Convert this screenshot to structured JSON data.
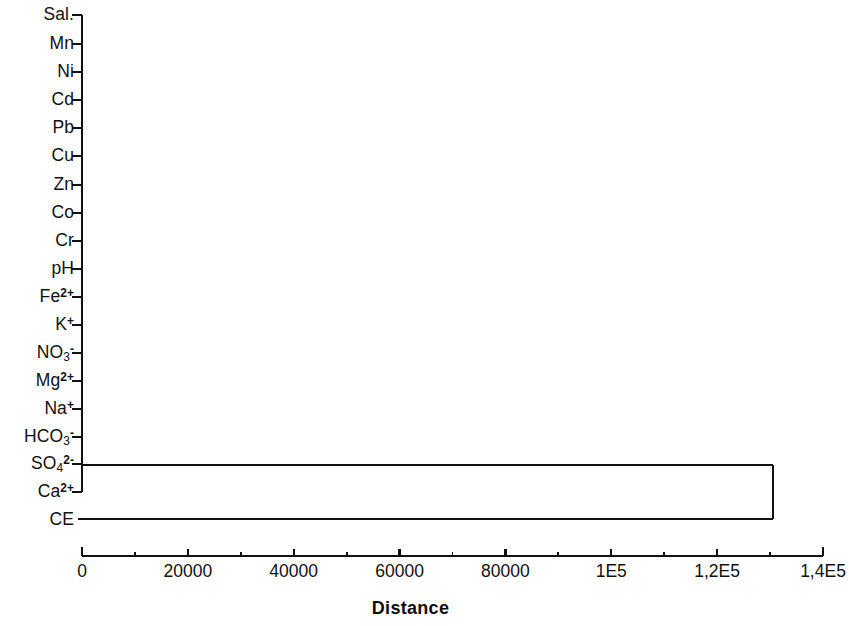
{
  "chart_data": {
    "type": "dendrogram",
    "title": "",
    "xlabel": "Distance",
    "ylabel": "",
    "xlim": [
      0,
      140000
    ],
    "grid": false,
    "legend": null,
    "orientation": "horizontal",
    "axis_x_pixels": {
      "x_at_min": 82,
      "x_at_max": 823
    },
    "xticks": [
      {
        "value": 0,
        "label": "0",
        "x": 82
      },
      {
        "value": 20000,
        "label": "20000",
        "x": 188
      },
      {
        "value": 40000,
        "label": "40000",
        "x": 294
      },
      {
        "value": 60000,
        "label": "60000",
        "x": 400
      },
      {
        "value": 80000,
        "label": "80000",
        "x": 506
      },
      {
        "value": 100000,
        "label": "1E5",
        "x": 612
      },
      {
        "value": 120000,
        "label": "1,2E5",
        "x": 718
      },
      {
        "value": 140000,
        "label": "1,4E5",
        "x": 823
      }
    ],
    "minor_tick_values": [
      10000,
      30000,
      50000,
      70000,
      90000,
      110000,
      130000
    ],
    "leaves": [
      {
        "label": "Sal.",
        "html": "Sal.",
        "y": 15
      },
      {
        "label": "Mn",
        "html": "Mn",
        "y": 44
      },
      {
        "label": "Ni",
        "html": "Ni",
        "y": 72
      },
      {
        "label": "Cd",
        "html": "Cd",
        "y": 100
      },
      {
        "label": "Pb",
        "html": "Pb",
        "y": 128
      },
      {
        "label": "Cu",
        "html": "Cu",
        "y": 156
      },
      {
        "label": "Zn",
        "html": "Zn",
        "y": 185
      },
      {
        "label": "Co",
        "html": "Co",
        "y": 213
      },
      {
        "label": "Cr",
        "html": "Cr",
        "y": 241
      },
      {
        "label": "pH",
        "html": "pH",
        "y": 269
      },
      {
        "label": "Fe2+",
        "html": "Fe<sup>2+</sup>",
        "y": 297
      },
      {
        "label": "K+",
        "html": "K<sup>+</sup>",
        "y": 325
      },
      {
        "label": "NO3-",
        "html": "NO<sub>3</sub><sup>-</sup>",
        "y": 353
      },
      {
        "label": "Mg2+",
        "html": "Mg<sup>2+</sup>",
        "y": 381
      },
      {
        "label": "Na+",
        "html": "Na<sup>+</sup>",
        "y": 409
      },
      {
        "label": "HCO3-",
        "html": "HCO<sub>3</sub><sup>-</sup>",
        "y": 437
      },
      {
        "label": "SO4 2-",
        "html": "SO<sub>4</sub><sup>2-</sup>",
        "y": 464
      },
      {
        "label": "Ca2+",
        "html": "Ca<sup>2+</sup>",
        "y": 492
      },
      {
        "label": "CE",
        "html": "CE",
        "y": 520
      }
    ],
    "merges": [
      {
        "name": "cluster-variables",
        "distance": 0,
        "x": 82,
        "y_top": 15,
        "y_bottom": 492,
        "members": [
          "Sal.",
          "Mn",
          "Ni",
          "Cd",
          "Pb",
          "Cu",
          "Zn",
          "Co",
          "Cr",
          "pH",
          "Fe2+",
          "K+",
          "NO3-",
          "Mg2+",
          "Na+",
          "HCO3-",
          "SO4 2-",
          "Ca2+"
        ]
      },
      {
        "name": "root-merge",
        "distance": 130500,
        "x": 773,
        "y_top": 465,
        "y_bottom": 519,
        "members": [
          "cluster-variables",
          "CE"
        ]
      }
    ],
    "line_color": "#111111",
    "background_color": "#ffffff"
  },
  "axis": {
    "title": "Distance"
  }
}
